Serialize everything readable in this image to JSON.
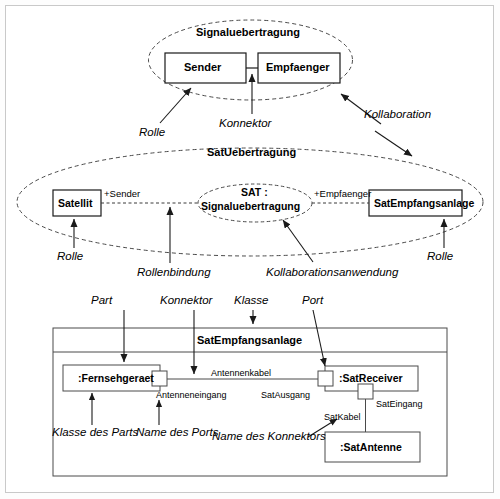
{
  "diagram": {
    "colors": {
      "stroke": "#1a1a1a",
      "dashed": "#555555",
      "frame": "#c9c9c9",
      "background": "#ffffff"
    }
  },
  "collaboration_template": {
    "ellipse_label": "Signaluebertragung",
    "roles": [
      {
        "name": "Sender"
      },
      {
        "name": "Empfaenger"
      }
    ]
  },
  "collaboration_use": {
    "ellipse_label": "SatUebertragung",
    "inner_ellipse_line1": "SAT :",
    "inner_ellipse_line2": "Signaluebertragung",
    "classifiers": [
      {
        "name": "Satellit"
      },
      {
        "name": "SatEmpfangsanlage"
      }
    ],
    "role_bindings": [
      {
        "label": "+Sender"
      },
      {
        "label": "+Empfaenger"
      }
    ]
  },
  "composite_structure": {
    "class_name": "SatEmpfangsanlage",
    "parts": [
      {
        "name": ":Fernsehgeraet"
      },
      {
        "name": ":SatReceiver"
      },
      {
        "name": ":SatAntenne"
      }
    ],
    "ports": [
      {
        "name": "Antenneneingang"
      },
      {
        "name": "SatAusgang"
      },
      {
        "name": "SatEingang"
      }
    ],
    "connectors": [
      {
        "name": "Antennenkabel"
      },
      {
        "name": "SatKabel"
      }
    ]
  },
  "annotations": {
    "rolle_top": "Rolle",
    "konnektor_top": "Konnektor",
    "kollaboration": "Kollaboration",
    "rolle_left": "Rolle",
    "rolle_right": "Rolle",
    "rollenbindung": "Rollenbindung",
    "kollaborationsanwendung": "Kollaborationsanwendung",
    "part": "Part",
    "konnektor_mid": "Konnektor",
    "klasse": "Klasse",
    "port": "Port",
    "klasse_des_parts": "Klasse des Parts",
    "name_des_ports": "Name des Ports",
    "name_des_konnektors": "Name des Konnektors"
  }
}
